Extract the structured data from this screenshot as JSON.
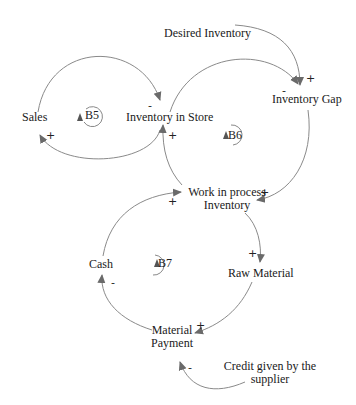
{
  "diagram": {
    "type": "causal-loop-diagram",
    "nodes": {
      "desired_inventory": "Desired Inventory",
      "sales": "Sales",
      "inventory_in_store": "Inventory in Store",
      "inventory_gap": "Inventory Gap",
      "wip_line1": "Work in process",
      "wip_line2": "Inventory",
      "cash": "Cash",
      "raw_material": "Raw Material",
      "material_payment_line1": "Material",
      "material_payment_line2": "Payment",
      "credit_line1": "Credit given by the",
      "credit_line2": "supplier"
    },
    "loops": {
      "b5": "B5",
      "b6": "B6",
      "b7": "B7"
    },
    "signs": {
      "sales_to_inv_store": "-",
      "inv_store_to_sales": "+",
      "wip_to_inv_store": "+",
      "desired_to_gap": "+",
      "inv_store_to_gap": "-",
      "gap_to_wip": "+",
      "cash_to_wip": "+",
      "wip_to_raw": "+",
      "raw_to_payment": "+",
      "payment_to_cash": "-",
      "credit_to_payment": "-"
    },
    "edge_color": "#7a7a7a",
    "arrowhead_color": "#6a6a6a"
  }
}
